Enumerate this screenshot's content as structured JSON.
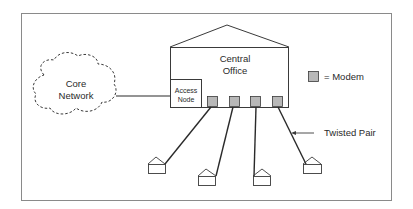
{
  "diagram": {
    "type": "network-topology",
    "central_office": {
      "line1": "Central",
      "line2": "Office"
    },
    "access_node": {
      "line1": "Access",
      "line2": "Node"
    },
    "core_network": {
      "line1": "Core",
      "line2": "Network"
    },
    "legend": {
      "symbol": "modem-square",
      "text": "= Modem"
    },
    "twisted_pair_label": "Twisted Pair",
    "modem_count": 4,
    "house_count": 4,
    "colors": {
      "line": "#2a2a2a",
      "modem_fill": "#b8b8b8",
      "frame": "#8a8a8a",
      "background": "#ffffff"
    }
  }
}
